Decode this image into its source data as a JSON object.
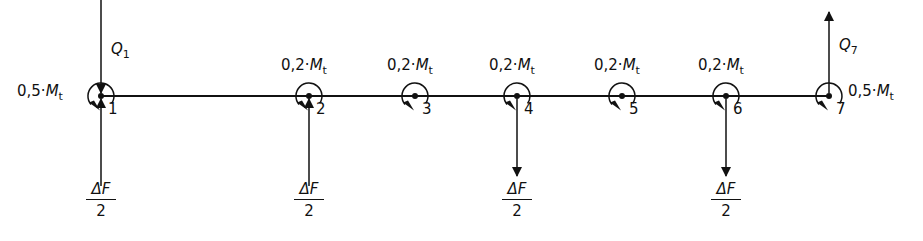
{
  "diagram": {
    "nodes": [
      {
        "id": "1",
        "x": 101,
        "moment": "0,5",
        "moment_side": "left"
      },
      {
        "id": "2",
        "x": 309,
        "moment": "0,2",
        "moment_side": "top"
      },
      {
        "id": "3",
        "x": 415,
        "moment": "0,2",
        "moment_side": "top"
      },
      {
        "id": "4",
        "x": 517,
        "moment": "0,2",
        "moment_side": "top"
      },
      {
        "id": "5",
        "x": 622,
        "moment": "0,2",
        "moment_side": "top"
      },
      {
        "id": "6",
        "x": 726,
        "moment": "0,2",
        "moment_side": "top"
      },
      {
        "id": "7",
        "x": 829,
        "moment": "0,5",
        "moment_side": "right"
      }
    ],
    "moment_symbol": "M",
    "moment_subscript": "t",
    "multiply_dot": "·",
    "reactions": [
      {
        "label": "Q",
        "subscript": "1",
        "node": "1",
        "direction": "down-into-node"
      },
      {
        "label": "Q",
        "subscript": "7",
        "node": "7",
        "direction": "up"
      }
    ],
    "loads": [
      {
        "node": "1",
        "direction": "up",
        "numerator": "ΔF",
        "denominator": "2"
      },
      {
        "node": "2",
        "direction": "up",
        "numerator": "ΔF",
        "denominator": "2"
      },
      {
        "node": "4",
        "direction": "down",
        "numerator": "ΔF",
        "denominator": "2"
      },
      {
        "node": "6",
        "direction": "down",
        "numerator": "ΔF",
        "denominator": "2"
      }
    ],
    "beam": {
      "x_start": 101,
      "x_end": 829,
      "y": 96
    },
    "colors": {
      "ink": "#111111",
      "background": "#ffffff"
    }
  }
}
